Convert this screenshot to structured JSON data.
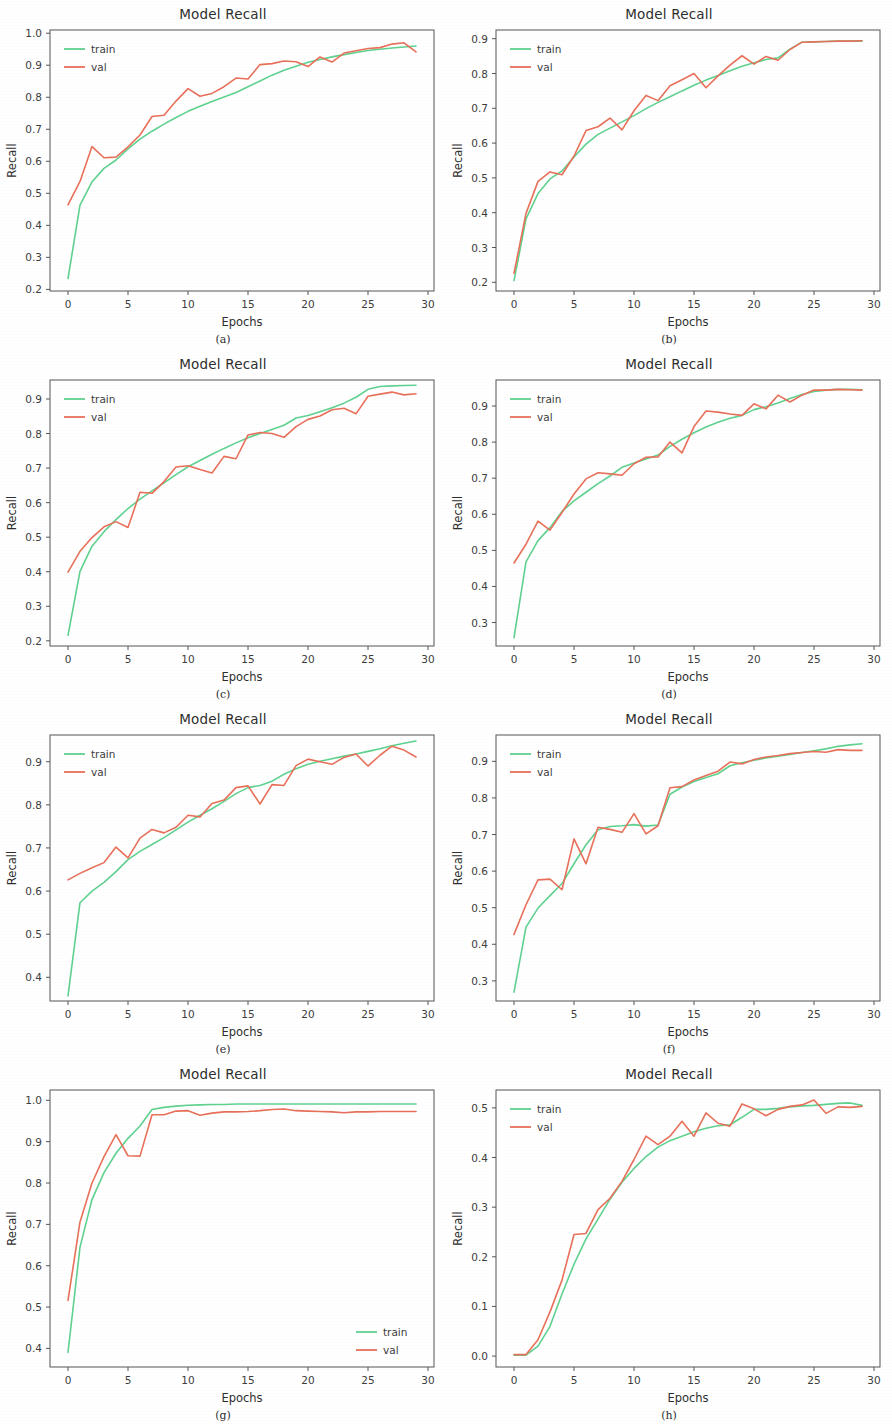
{
  "figure": {
    "panel_count": 8,
    "colors": {
      "train": "#5fd18f",
      "val": "#e8705a",
      "axis": "#555555",
      "text": "#2e2e2e"
    },
    "legend_labels": {
      "train": "train",
      "val": "val"
    }
  },
  "chart_data": [
    {
      "id": "a",
      "caption": "(a)",
      "type": "line",
      "title": "Model Recall",
      "xlabel": "Epochs",
      "ylabel": "Recall",
      "xlim": [
        -1.5,
        30.5
      ],
      "ylim": [
        0.195,
        1.01
      ],
      "xticks": [
        0,
        5,
        10,
        15,
        20,
        25,
        30
      ],
      "yticks": [
        0.2,
        0.3,
        0.4,
        0.5,
        0.6,
        0.7,
        0.8,
        0.9,
        1.0
      ],
      "ytick_labels": [
        "0.2",
        "0.3",
        "0.4",
        "0.5",
        "0.6",
        "0.7",
        "0.8",
        "0.9",
        "1.0"
      ],
      "grid": false,
      "legend_position": "upper-left",
      "x": [
        0,
        1,
        2,
        3,
        4,
        5,
        6,
        7,
        8,
        9,
        10,
        11,
        12,
        13,
        14,
        15,
        16,
        17,
        18,
        19,
        20,
        21,
        22,
        23,
        24,
        25,
        26,
        27,
        28,
        29
      ],
      "series": [
        {
          "name": "train",
          "values": [
            0.234,
            0.463,
            0.536,
            0.578,
            0.604,
            0.639,
            0.669,
            0.694,
            0.716,
            0.737,
            0.756,
            0.772,
            0.787,
            0.801,
            0.815,
            0.833,
            0.851,
            0.869,
            0.884,
            0.897,
            0.909,
            0.918,
            0.926,
            0.933,
            0.94,
            0.946,
            0.95,
            0.954,
            0.957,
            0.96
          ]
        },
        {
          "name": "val",
          "values": [
            0.464,
            0.537,
            0.646,
            0.611,
            0.613,
            0.645,
            0.682,
            0.74,
            0.744,
            0.788,
            0.827,
            0.803,
            0.812,
            0.833,
            0.86,
            0.857,
            0.902,
            0.905,
            0.913,
            0.911,
            0.896,
            0.926,
            0.91,
            0.938,
            0.945,
            0.952,
            0.955,
            0.966,
            0.97,
            0.942
          ]
        }
      ]
    },
    {
      "id": "b",
      "caption": "(b)",
      "type": "line",
      "title": "Model Recall",
      "xlabel": "Epochs",
      "ylabel": "Recall",
      "xlim": [
        -1.5,
        30.5
      ],
      "ylim": [
        0.175,
        0.925
      ],
      "xticks": [
        0,
        5,
        10,
        15,
        20,
        25,
        30
      ],
      "yticks": [
        0.2,
        0.3,
        0.4,
        0.5,
        0.6,
        0.7,
        0.8,
        0.9
      ],
      "ytick_labels": [
        "0.2",
        "0.3",
        "0.4",
        "0.5",
        "0.6",
        "0.7",
        "0.8",
        "0.9"
      ],
      "grid": false,
      "legend_position": "upper-left",
      "x": [
        0,
        1,
        2,
        3,
        4,
        5,
        6,
        7,
        8,
        9,
        10,
        11,
        12,
        13,
        14,
        15,
        16,
        17,
        18,
        19,
        20,
        21,
        22,
        23,
        24,
        25,
        26,
        27,
        28,
        29
      ],
      "series": [
        {
          "name": "train",
          "values": [
            0.205,
            0.382,
            0.455,
            0.497,
            0.52,
            0.56,
            0.597,
            0.625,
            0.643,
            0.661,
            0.679,
            0.699,
            0.717,
            0.733,
            0.75,
            0.766,
            0.781,
            0.794,
            0.808,
            0.821,
            0.831,
            0.84,
            0.845,
            0.87,
            0.89,
            0.891,
            0.892,
            0.893,
            0.893,
            0.893
          ]
        },
        {
          "name": "val",
          "values": [
            0.226,
            0.398,
            0.49,
            0.517,
            0.509,
            0.563,
            0.636,
            0.647,
            0.672,
            0.638,
            0.693,
            0.737,
            0.722,
            0.765,
            0.782,
            0.8,
            0.759,
            0.793,
            0.824,
            0.851,
            0.827,
            0.849,
            0.838,
            0.869,
            0.89,
            0.891,
            0.892,
            0.893,
            0.893,
            0.894
          ]
        }
      ]
    },
    {
      "id": "c",
      "caption": "(c)",
      "type": "line",
      "title": "Model Recall",
      "xlabel": "Epochs",
      "ylabel": "Recall",
      "xlim": [
        -1.5,
        30.5
      ],
      "ylim": [
        0.185,
        0.955
      ],
      "xticks": [
        0,
        5,
        10,
        15,
        20,
        25,
        30
      ],
      "yticks": [
        0.2,
        0.3,
        0.4,
        0.5,
        0.6,
        0.7,
        0.8,
        0.9
      ],
      "ytick_labels": [
        "0.2",
        "0.3",
        "0.4",
        "0.5",
        "0.6",
        "0.7",
        "0.8",
        "0.9"
      ],
      "grid": false,
      "legend_position": "upper-left",
      "x": [
        0,
        1,
        2,
        3,
        4,
        5,
        6,
        7,
        8,
        9,
        10,
        11,
        12,
        13,
        14,
        15,
        16,
        17,
        18,
        19,
        20,
        21,
        22,
        23,
        24,
        25,
        26,
        27,
        28,
        29
      ],
      "series": [
        {
          "name": "train",
          "values": [
            0.216,
            0.401,
            0.474,
            0.516,
            0.551,
            0.583,
            0.61,
            0.634,
            0.657,
            0.681,
            0.704,
            0.722,
            0.74,
            0.757,
            0.773,
            0.788,
            0.8,
            0.812,
            0.824,
            0.845,
            0.852,
            0.863,
            0.875,
            0.888,
            0.905,
            0.928,
            0.936,
            0.938,
            0.939,
            0.94
          ]
        },
        {
          "name": "val",
          "values": [
            0.399,
            0.459,
            0.499,
            0.53,
            0.545,
            0.528,
            0.63,
            0.627,
            0.661,
            0.703,
            0.707,
            0.696,
            0.686,
            0.734,
            0.727,
            0.796,
            0.803,
            0.8,
            0.789,
            0.82,
            0.841,
            0.851,
            0.869,
            0.873,
            0.857,
            0.908,
            0.914,
            0.92,
            0.912,
            0.915
          ]
        }
      ]
    },
    {
      "id": "d",
      "caption": "(d)",
      "type": "line",
      "title": "Model Recall",
      "xlabel": "Epochs",
      "ylabel": "Recall",
      "xlim": [
        -1.5,
        30.5
      ],
      "ylim": [
        0.235,
        0.972
      ],
      "xticks": [
        0,
        5,
        10,
        15,
        20,
        25,
        30
      ],
      "yticks": [
        0.3,
        0.4,
        0.5,
        0.6,
        0.7,
        0.8,
        0.9
      ],
      "ytick_labels": [
        "0.3",
        "0.4",
        "0.5",
        "0.6",
        "0.7",
        "0.8",
        "0.9"
      ],
      "grid": false,
      "legend_position": "upper-left",
      "x": [
        0,
        1,
        2,
        3,
        4,
        5,
        6,
        7,
        8,
        9,
        10,
        11,
        12,
        13,
        14,
        15,
        16,
        17,
        18,
        19,
        20,
        21,
        22,
        23,
        24,
        25,
        26,
        27,
        28,
        29
      ],
      "series": [
        {
          "name": "train",
          "values": [
            0.258,
            0.468,
            0.527,
            0.563,
            0.608,
            0.637,
            0.661,
            0.685,
            0.706,
            0.73,
            0.742,
            0.753,
            0.764,
            0.788,
            0.808,
            0.826,
            0.842,
            0.855,
            0.866,
            0.874,
            0.89,
            0.898,
            0.908,
            0.921,
            0.932,
            0.94,
            0.944,
            0.946,
            0.946,
            0.945
          ]
        },
        {
          "name": "val",
          "values": [
            0.465,
            0.517,
            0.581,
            0.556,
            0.605,
            0.656,
            0.698,
            0.715,
            0.712,
            0.708,
            0.74,
            0.758,
            0.759,
            0.8,
            0.77,
            0.843,
            0.886,
            0.883,
            0.878,
            0.874,
            0.906,
            0.892,
            0.93,
            0.911,
            0.93,
            0.944,
            0.944,
            0.946,
            0.945,
            0.944
          ]
        }
      ]
    },
    {
      "id": "e",
      "caption": "(e)",
      "type": "line",
      "title": "Model Recall",
      "xlabel": "Epochs",
      "ylabel": "Recall",
      "xlim": [
        -1.5,
        30.5
      ],
      "ylim": [
        0.345,
        0.962
      ],
      "xticks": [
        0,
        5,
        10,
        15,
        20,
        25,
        30
      ],
      "yticks": [
        0.4,
        0.5,
        0.6,
        0.7,
        0.8,
        0.9
      ],
      "ytick_labels": [
        "0.4",
        "0.5",
        "0.6",
        "0.7",
        "0.8",
        "0.9"
      ],
      "grid": false,
      "legend_position": "upper-left",
      "x": [
        0,
        1,
        2,
        3,
        4,
        5,
        6,
        7,
        8,
        9,
        10,
        11,
        12,
        13,
        14,
        15,
        16,
        17,
        18,
        19,
        20,
        21,
        22,
        23,
        24,
        25,
        26,
        27,
        28,
        29
      ],
      "series": [
        {
          "name": "train",
          "values": [
            0.357,
            0.573,
            0.6,
            0.62,
            0.645,
            0.673,
            0.692,
            0.708,
            0.724,
            0.742,
            0.76,
            0.776,
            0.791,
            0.808,
            0.826,
            0.84,
            0.845,
            0.855,
            0.871,
            0.884,
            0.894,
            0.901,
            0.907,
            0.913,
            0.918,
            0.924,
            0.93,
            0.937,
            0.943,
            0.948
          ]
        },
        {
          "name": "val",
          "values": [
            0.626,
            0.641,
            0.654,
            0.666,
            0.702,
            0.677,
            0.723,
            0.743,
            0.735,
            0.748,
            0.776,
            0.772,
            0.803,
            0.811,
            0.84,
            0.844,
            0.802,
            0.847,
            0.845,
            0.891,
            0.906,
            0.9,
            0.894,
            0.91,
            0.918,
            0.89,
            0.915,
            0.936,
            0.927,
            0.911
          ]
        }
      ]
    },
    {
      "id": "f",
      "caption": "(f)",
      "type": "line",
      "title": "Model Recall",
      "xlabel": "Epochs",
      "ylabel": "Recall",
      "xlim": [
        -1.5,
        30.5
      ],
      "ylim": [
        0.245,
        0.972
      ],
      "xticks": [
        0,
        5,
        10,
        15,
        20,
        25,
        30
      ],
      "yticks": [
        0.3,
        0.4,
        0.5,
        0.6,
        0.7,
        0.8,
        0.9
      ],
      "ytick_labels": [
        "0.3",
        "0.4",
        "0.5",
        "0.6",
        "0.7",
        "0.8",
        "0.9"
      ],
      "grid": false,
      "legend_position": "upper-left",
      "x": [
        0,
        1,
        2,
        3,
        4,
        5,
        6,
        7,
        8,
        9,
        10,
        11,
        12,
        13,
        14,
        15,
        16,
        17,
        18,
        19,
        20,
        21,
        22,
        23,
        24,
        25,
        26,
        27,
        28,
        29
      ],
      "series": [
        {
          "name": "train",
          "values": [
            0.269,
            0.447,
            0.499,
            0.533,
            0.566,
            0.62,
            0.672,
            0.713,
            0.722,
            0.724,
            0.727,
            0.723,
            0.726,
            0.81,
            0.83,
            0.845,
            0.856,
            0.866,
            0.888,
            0.896,
            0.903,
            0.909,
            0.914,
            0.919,
            0.924,
            0.929,
            0.934,
            0.941,
            0.945,
            0.948
          ]
        },
        {
          "name": "val",
          "values": [
            0.427,
            0.508,
            0.576,
            0.578,
            0.549,
            0.688,
            0.62,
            0.72,
            0.714,
            0.706,
            0.757,
            0.702,
            0.724,
            0.828,
            0.831,
            0.849,
            0.861,
            0.873,
            0.898,
            0.893,
            0.905,
            0.912,
            0.916,
            0.921,
            0.924,
            0.927,
            0.925,
            0.932,
            0.93,
            0.93
          ]
        }
      ]
    },
    {
      "id": "g",
      "caption": "(g)",
      "type": "line",
      "title": "Model Recall",
      "xlabel": "Epochs",
      "ylabel": "Recall",
      "xlim": [
        -1.5,
        30.5
      ],
      "ylim": [
        0.355,
        1.025
      ],
      "xticks": [
        0,
        5,
        10,
        15,
        20,
        25,
        30
      ],
      "yticks": [
        0.4,
        0.5,
        0.6,
        0.7,
        0.8,
        0.9,
        1.0
      ],
      "ytick_labels": [
        "0.4",
        "0.5",
        "0.6",
        "0.7",
        "0.8",
        "0.9",
        "1.0"
      ],
      "grid": false,
      "legend_position": "lower-right",
      "x": [
        0,
        1,
        2,
        3,
        4,
        5,
        6,
        7,
        8,
        9,
        10,
        11,
        12,
        13,
        14,
        15,
        16,
        17,
        18,
        19,
        20,
        21,
        22,
        23,
        24,
        25,
        26,
        27,
        28,
        29
      ],
      "series": [
        {
          "name": "train",
          "values": [
            0.39,
            0.645,
            0.76,
            0.825,
            0.872,
            0.908,
            0.938,
            0.978,
            0.983,
            0.986,
            0.988,
            0.989,
            0.99,
            0.99,
            0.991,
            0.991,
            0.991,
            0.991,
            0.991,
            0.991,
            0.991,
            0.991,
            0.991,
            0.991,
            0.991,
            0.991,
            0.991,
            0.991,
            0.991,
            0.991
          ]
        },
        {
          "name": "val",
          "values": [
            0.516,
            0.706,
            0.8,
            0.864,
            0.917,
            0.866,
            0.865,
            0.965,
            0.965,
            0.974,
            0.975,
            0.964,
            0.969,
            0.972,
            0.972,
            0.973,
            0.975,
            0.978,
            0.979,
            0.975,
            0.974,
            0.973,
            0.972,
            0.97,
            0.972,
            0.972,
            0.973,
            0.973,
            0.973,
            0.973
          ]
        }
      ]
    },
    {
      "id": "h",
      "caption": "(h)",
      "type": "line",
      "title": "Model Recall",
      "xlabel": "Epochs",
      "ylabel": "Recall",
      "xlim": [
        -1.5,
        30.5
      ],
      "ylim": [
        -0.022,
        0.536
      ],
      "xticks": [
        0,
        5,
        10,
        15,
        20,
        25,
        30
      ],
      "yticks": [
        0.0,
        0.1,
        0.2,
        0.3,
        0.4,
        0.5
      ],
      "ytick_labels": [
        "0.0",
        "0.1",
        "0.2",
        "0.3",
        "0.4",
        "0.5"
      ],
      "grid": false,
      "legend_position": "upper-left",
      "x": [
        0,
        1,
        2,
        3,
        4,
        5,
        6,
        7,
        8,
        9,
        10,
        11,
        12,
        13,
        14,
        15,
        16,
        17,
        18,
        19,
        20,
        21,
        22,
        23,
        24,
        25,
        26,
        27,
        28,
        29
      ],
      "series": [
        {
          "name": "train",
          "values": [
            0.002,
            0.002,
            0.02,
            0.06,
            0.125,
            0.185,
            0.236,
            0.276,
            0.316,
            0.35,
            0.378,
            0.402,
            0.421,
            0.434,
            0.443,
            0.452,
            0.459,
            0.464,
            0.466,
            0.481,
            0.497,
            0.497,
            0.499,
            0.502,
            0.504,
            0.505,
            0.507,
            0.509,
            0.51,
            0.505
          ]
        },
        {
          "name": "val",
          "values": [
            0.003,
            0.003,
            0.033,
            0.089,
            0.153,
            0.245,
            0.247,
            0.295,
            0.318,
            0.352,
            0.396,
            0.443,
            0.426,
            0.443,
            0.473,
            0.443,
            0.49,
            0.469,
            0.463,
            0.508,
            0.498,
            0.484,
            0.497,
            0.503,
            0.506,
            0.516,
            0.489,
            0.502,
            0.501,
            0.503
          ]
        }
      ]
    }
  ]
}
